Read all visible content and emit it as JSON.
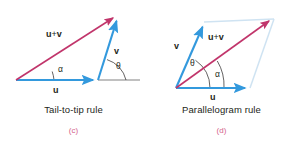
{
  "figure": {
    "background_color": "#ffffff",
    "vector_blue": "#3399dd",
    "vector_pink": "#c1356b",
    "ghost_blue": "#cfe3f2",
    "axis_gray": "#4a4a4a",
    "text_color": "#231f20",
    "sublabel_color": "#d4648c"
  },
  "panels": [
    {
      "id": "c",
      "caption": "Tail-to-tip rule",
      "sublabel": "(c)",
      "labels": {
        "sum": {
          "u": "u",
          "plus": "+",
          "v": "v"
        },
        "u": "u",
        "v": "v",
        "alpha": "α",
        "theta": "θ"
      },
      "geometry": {
        "origin": [
          16,
          80
        ],
        "u_tip": [
          98,
          80
        ],
        "v_tip": [
          118,
          16
        ],
        "axis_end": [
          140,
          80
        ]
      }
    },
    {
      "id": "d",
      "caption": "Parallelogram rule",
      "sublabel": "(d)",
      "labels": {
        "sum": {
          "u": "u",
          "plus": "+",
          "v": "v"
        },
        "u": "u",
        "v": "v",
        "alpha": "α",
        "theta": "θ"
      },
      "geometry": {
        "origin": [
          28,
          88
        ],
        "u_tip": [
          102,
          88
        ],
        "v_tip": [
          56,
          22
        ],
        "sum_tip": [
          124,
          18
        ]
      }
    }
  ]
}
